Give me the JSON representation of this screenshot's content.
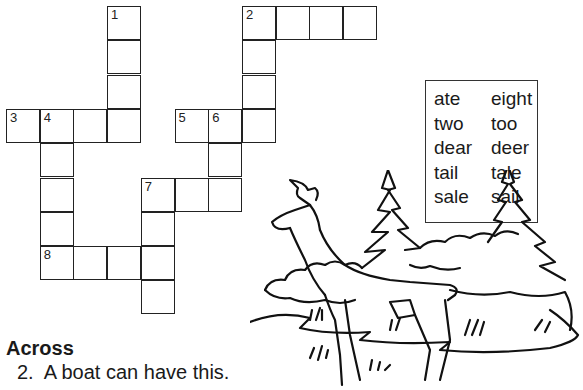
{
  "puzzle": {
    "cell_size": 34,
    "origin": {
      "x": 6,
      "y": 6
    },
    "cells": [
      {
        "r": 0,
        "c": 3,
        "num": "1"
      },
      {
        "r": 1,
        "c": 3
      },
      {
        "r": 2,
        "c": 3
      },
      {
        "r": 0,
        "c": 7,
        "num": "2"
      },
      {
        "r": 0,
        "c": 8
      },
      {
        "r": 0,
        "c": 9
      },
      {
        "r": 0,
        "c": 10
      },
      {
        "r": 1,
        "c": 7
      },
      {
        "r": 2,
        "c": 7
      },
      {
        "r": 3,
        "c": 0,
        "num": "3"
      },
      {
        "r": 3,
        "c": 1,
        "num": "4"
      },
      {
        "r": 3,
        "c": 2
      },
      {
        "r": 3,
        "c": 3
      },
      {
        "r": 3,
        "c": 5,
        "num": "5"
      },
      {
        "r": 3,
        "c": 6,
        "num": "6"
      },
      {
        "r": 3,
        "c": 7
      },
      {
        "r": 4,
        "c": 1
      },
      {
        "r": 5,
        "c": 1
      },
      {
        "r": 6,
        "c": 1
      },
      {
        "r": 4,
        "c": 6
      },
      {
        "r": 5,
        "c": 4,
        "num": "7"
      },
      {
        "r": 5,
        "c": 5
      },
      {
        "r": 5,
        "c": 6
      },
      {
        "r": 6,
        "c": 4
      },
      {
        "r": 7,
        "c": 1,
        "num": "8"
      },
      {
        "r": 7,
        "c": 2
      },
      {
        "r": 7,
        "c": 3
      },
      {
        "r": 7,
        "c": 4
      },
      {
        "r": 8,
        "c": 4
      }
    ]
  },
  "word_bank": {
    "left": [
      "ate",
      "two",
      "dear",
      "tail",
      "sale"
    ],
    "right": [
      "eight",
      "too",
      "deer",
      "tale",
      "sail"
    ]
  },
  "clues": {
    "across_heading": "Across",
    "across": [
      {
        "number": "2.",
        "text": "A boat can have this."
      }
    ]
  },
  "illustration": {
    "description": "deer-in-forest"
  }
}
